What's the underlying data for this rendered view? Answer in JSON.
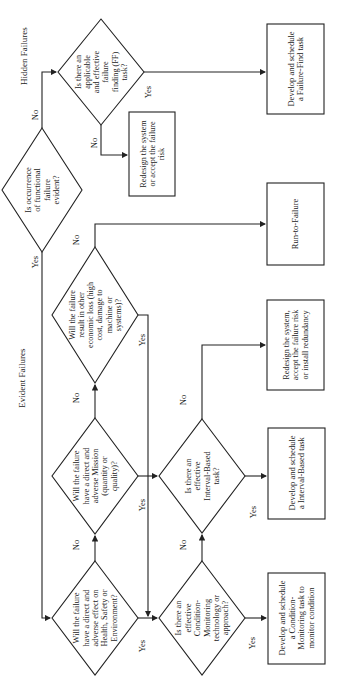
{
  "sections": {
    "hidden": "Hidden Failures",
    "evident": "Evident Failures"
  },
  "decisions": {
    "evident": [
      "Is occurrence",
      "of functional",
      "failure",
      "evident?"
    ],
    "ff_task": [
      "Is there an",
      "applicable",
      "and effective",
      "failure",
      "finding (FF)",
      "task?"
    ],
    "economic": [
      "Will the failure",
      "result in other",
      "economic loss (high",
      "cost, damage to",
      "machine or",
      "systems)?"
    ],
    "mission": [
      "Will the failure",
      "have a direct and",
      "adverse Mission",
      "(quantity or",
      "quality)?"
    ],
    "hse": [
      "Will the failure",
      "have a direct and",
      "adverse effect on",
      "Health, Safety or",
      "Environment?"
    ],
    "interval": [
      "Is there an",
      "effective",
      "Interval-Based",
      "task?"
    ],
    "condition": [
      "Is there an",
      "effective",
      "Condition-",
      "Monitoring",
      "technology or",
      "approach?"
    ]
  },
  "actions": {
    "failure_find": [
      "Develop and schedule",
      "a Failure-Find task"
    ],
    "redesign_accept": [
      "Redesign the system",
      "or accept the failure",
      "risk"
    ],
    "run_to_failure": [
      "Run-to-Failure"
    ],
    "redesign_redundancy": [
      "Redesign the system,",
      "accept the failure risk",
      "or install redundancy"
    ],
    "interval_task": [
      "Develop and schedule",
      "a Interval-Based task"
    ],
    "condition_task": [
      "Develop and schedule",
      "a Condition-",
      "Monitoring task to",
      "monitor condition"
    ]
  },
  "edge_labels": {
    "yes": "Yes",
    "no": "No"
  },
  "colors": {
    "line": "#222222",
    "background": "#ffffff"
  }
}
